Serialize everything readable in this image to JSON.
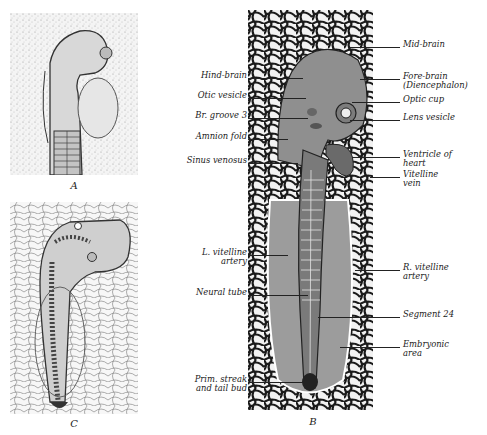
{
  "figure": {
    "panels": [
      {
        "id": "A",
        "caption": "A"
      },
      {
        "id": "B",
        "caption": "B"
      },
      {
        "id": "C",
        "caption": "C"
      }
    ],
    "labels_left": [
      {
        "text": "Hind-brain",
        "y": 76
      },
      {
        "text": "Otic vesicle",
        "y": 96
      },
      {
        "text": "Br. groove 3",
        "y": 116
      },
      {
        "text": "Amnion fold",
        "y": 137
      },
      {
        "text": "Sinus venosus",
        "y": 161
      },
      {
        "text": "L. vitelline\nartery",
        "y": 250
      },
      {
        "text": "Neural tube",
        "y": 293
      },
      {
        "text": "Prim. streak\nand tail bud",
        "y": 375
      }
    ],
    "labels_right": [
      {
        "text": "Mid-brain",
        "y": 43
      },
      {
        "text": "Fore-brain\n(Diencephalon)",
        "y": 78
      },
      {
        "text": "Optic cup",
        "y": 100
      },
      {
        "text": "Lens vesicle",
        "y": 118
      },
      {
        "text": "Ventricle of\nheart",
        "y": 152
      },
      {
        "text": "Vitelline\nvein",
        "y": 180
      },
      {
        "text": "R. vitelline\nartery",
        "y": 268
      },
      {
        "text": "Segment 24",
        "y": 312
      },
      {
        "text": "Embryonic\narea",
        "y": 346
      }
    ]
  }
}
